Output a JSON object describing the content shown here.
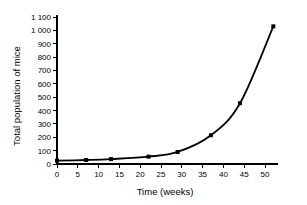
{
  "chart_data": {
    "type": "line",
    "title": "",
    "xlabel": "Time (weeks)",
    "ylabel": "Total population of mice",
    "xlim": [
      0,
      53
    ],
    "ylim": [
      0,
      1100
    ],
    "grid": false,
    "legend": "none",
    "x_ticks": [
      0,
      5,
      10,
      15,
      20,
      25,
      30,
      35,
      40,
      45,
      50
    ],
    "x_tick_labels": [
      "0",
      "5",
      "10",
      "15",
      "20",
      "25",
      "30",
      "35",
      "40",
      "45",
      "50"
    ],
    "y_ticks": [
      0,
      100,
      200,
      300,
      400,
      500,
      600,
      700,
      800,
      900,
      1000,
      1100
    ],
    "y_tick_labels": [
      "0",
      "100",
      "200",
      "300",
      "400",
      "500",
      "600",
      "700",
      "800",
      "900",
      "1 000",
      "1 100"
    ],
    "series": [
      {
        "name": "Total population of mice",
        "color": "#000000",
        "marker": "square",
        "x": [
          0,
          7,
          13,
          22,
          29,
          37,
          44,
          52
        ],
        "values": [
          25,
          30,
          37,
          55,
          90,
          215,
          455,
          1030
        ]
      }
    ]
  }
}
